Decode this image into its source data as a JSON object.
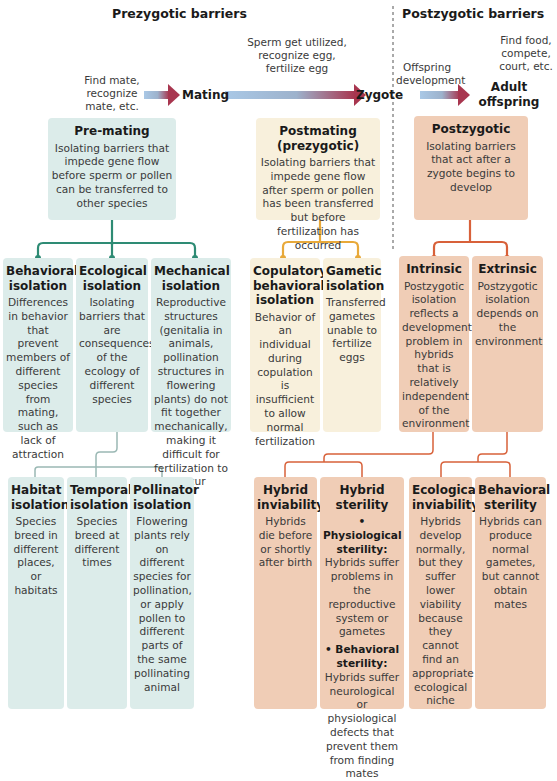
{
  "headers": {
    "prezygotic": "Prezygotic barriers",
    "postzygotic": "Postzygotic barriers"
  },
  "timeline": {
    "step1_caption": "Find mate, recognize mate, etc.",
    "stage_mating": "Mating",
    "step2_caption": "Sperm get utilized, recognize egg, fertilize egg",
    "stage_zygote": "Zygote",
    "step3_caption": "Offspring development",
    "step4_caption": "Find food, compete, court, etc.",
    "stage_adult": "Adult offspring"
  },
  "categories": {
    "premating": {
      "title": "Pre-mating",
      "desc": "Isolating barriers that impede gene flow before sperm or pollen can be transferred to other species"
    },
    "postmating": {
      "title": "Postmating (prezygotic)",
      "desc": "Isolating barriers that impede gene flow after sperm or pollen has been transferred but before fertilization has occurred"
    },
    "postzygotic": {
      "title": "Postzygotic",
      "desc": "Isolating barriers that act after a zygote begins to develop"
    }
  },
  "row2": [
    {
      "title": "Behavioral isolation",
      "desc": "Differences in behavior that prevent members of different species from mating, such as lack of attraction"
    },
    {
      "title": "Ecological isolation",
      "desc": "Isolating barriers that are consequences of the ecology of different species"
    },
    {
      "title": "Mechanical isolation",
      "desc": "Reproductive structures (genitalia in animals, pollination structures in flowering plants) do not fit together mechanically, making it difficult for fertilization to occur"
    },
    {
      "title": "Copulatory behavioral isolation",
      "desc": "Behavior of an individual during copulation is insufficient to allow normal fertilization"
    },
    {
      "title": "Gametic isolation",
      "desc": "Transferred gametes unable to fertilize eggs"
    },
    {
      "title": "Intrinsic",
      "desc": "Postzygotic isolation reflects a developmental problem in hybrids that is relatively independent of the environment"
    },
    {
      "title": "Extrinsic",
      "desc": "Postzygotic isolation depends on the environment"
    }
  ],
  "row3": [
    {
      "title": "Habitat isolation",
      "desc": "Species breed in different places, or habitats"
    },
    {
      "title": "Temporal isolation",
      "desc": "Species breed at different times"
    },
    {
      "title": "Pollinator isolation",
      "desc": "Flowering plants rely on different species for pollination, or apply pollen to different parts of the same pollinating animal"
    },
    {
      "title": "Hybrid inviability",
      "desc": "Hybrids die before or shortly after birth"
    },
    {
      "title": "Hybrid sterility",
      "bullet1_label": "• Physiological sterility:",
      "bullet1_text": "Hybrids suffer problems in the reproductive system or gametes",
      "bullet2_label": "• Behavioral sterility:",
      "bullet2_text": "Hybrids suffer neurological or physiological defects that prevent them from finding mates"
    },
    {
      "title": "Ecological inviability",
      "desc": "Hybrids develop normally, but they suffer lower viability because they cannot find an appropriate ecological niche"
    },
    {
      "title": "Behavioral sterility",
      "desc": "Hybrids can produce normal gametes, but cannot obtain mates"
    }
  ],
  "colors": {
    "teal_box": "#dcecea",
    "teal_line": "#2e8b74",
    "cream_box": "#f8f0dc",
    "gold_line": "#e8a93a",
    "peach_box": "#f0cdb6",
    "orange_line": "#d8613a",
    "arrow_start": "#a9c8e6",
    "arrow_end": "#a8364f"
  }
}
